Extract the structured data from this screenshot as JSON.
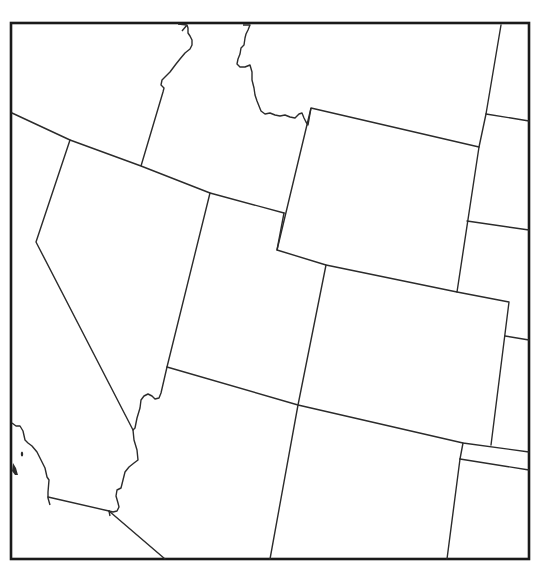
{
  "map": {
    "type": "state-outline-map",
    "region": "Western United States",
    "labels_visible": false,
    "colors": {
      "background": "#ffffff",
      "border_stroke": "#2b2b2b",
      "frame_stroke": "#1a1a1a"
    },
    "frame": {
      "x": 11,
      "y": 23,
      "width": 518,
      "height": 536
    },
    "states": [
      {
        "name": "Washington",
        "visible_part": "none"
      },
      {
        "name": "Oregon",
        "visible_part": "south-east corner (top-left region)"
      },
      {
        "name": "Idaho",
        "visible_part": "southern portion"
      },
      {
        "name": "Montana",
        "visible_part": "south-west corner (top center)"
      },
      {
        "name": "Wyoming",
        "visible_part": "full outline"
      },
      {
        "name": "South Dakota",
        "visible_part": "western edge (far right top)"
      },
      {
        "name": "Nebraska",
        "visible_part": "western edge (right)"
      },
      {
        "name": "Kansas",
        "visible_part": "western edge (right)"
      },
      {
        "name": "Oklahoma",
        "visible_part": "panhandle tip (right)"
      },
      {
        "name": "Texas",
        "visible_part": "panhandle (bottom right)"
      },
      {
        "name": "California",
        "visible_part": "eastern/southern portion (left)"
      },
      {
        "name": "Nevada",
        "visible_part": "full outline"
      },
      {
        "name": "Utah",
        "visible_part": "full outline"
      },
      {
        "name": "Colorado",
        "visible_part": "full outline"
      },
      {
        "name": "Arizona",
        "visible_part": "northern portion"
      },
      {
        "name": "New Mexico",
        "visible_part": "northern portion"
      },
      {
        "name": "Mexico (Baja)",
        "visible_part": "border corner (bottom left)"
      }
    ]
  }
}
